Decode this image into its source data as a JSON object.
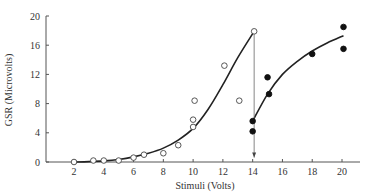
{
  "chart_data": {
    "type": "scatter",
    "title": "",
    "xlabel": "Stimuli (Volts)",
    "ylabel": "GSR (Microvolts)",
    "xlim": [
      0,
      21.5
    ],
    "ylim": [
      0,
      20
    ],
    "x_ticks": [
      2,
      4,
      6,
      8,
      10,
      12,
      14,
      16,
      18,
      20
    ],
    "y_ticks": [
      0,
      4,
      8,
      12,
      16,
      20
    ],
    "grid": false,
    "legend": null,
    "series": [
      {
        "name": "open circles",
        "marker": "open-circle",
        "points": [
          [
            2,
            0
          ],
          [
            3.3,
            0.2
          ],
          [
            4,
            0.2
          ],
          [
            5,
            0.2
          ],
          [
            6,
            0.6
          ],
          [
            6.7,
            1.0
          ],
          [
            8,
            1.2
          ],
          [
            9,
            2.3
          ],
          [
            10,
            4.8
          ],
          [
            10,
            5.8
          ],
          [
            10.1,
            8.4
          ],
          [
            12.1,
            13.2
          ],
          [
            13.1,
            8.4
          ],
          [
            14.1,
            17.9
          ]
        ],
        "curve": [
          [
            2,
            0
          ],
          [
            3,
            0.05
          ],
          [
            4,
            0.15
          ],
          [
            5,
            0.35
          ],
          [
            6,
            0.7
          ],
          [
            7,
            1.2
          ],
          [
            8,
            1.9
          ],
          [
            9,
            3.0
          ],
          [
            10,
            4.6
          ],
          [
            11,
            7.2
          ],
          [
            12,
            10.6
          ],
          [
            13,
            14.3
          ],
          [
            14.1,
            17.9
          ]
        ]
      },
      {
        "name": "filled circles",
        "marker": "filled-circle",
        "points": [
          [
            14,
            4.2
          ],
          [
            14,
            5.6
          ],
          [
            15,
            11.6
          ],
          [
            15.1,
            9.3
          ],
          [
            18,
            14.8
          ],
          [
            20.1,
            18.5
          ],
          [
            20.1,
            15.5
          ]
        ],
        "curve": [
          [
            14,
            5.6
          ],
          [
            15,
            9.3
          ],
          [
            16,
            12.0
          ],
          [
            17,
            13.8
          ],
          [
            18,
            15.2
          ],
          [
            19,
            16.3
          ],
          [
            20.1,
            17.3
          ]
        ]
      }
    ],
    "annotations": [
      {
        "type": "arrow",
        "from": [
          14.1,
          17.9
        ],
        "to": [
          14.1,
          0.6
        ],
        "direction": "down"
      }
    ]
  }
}
